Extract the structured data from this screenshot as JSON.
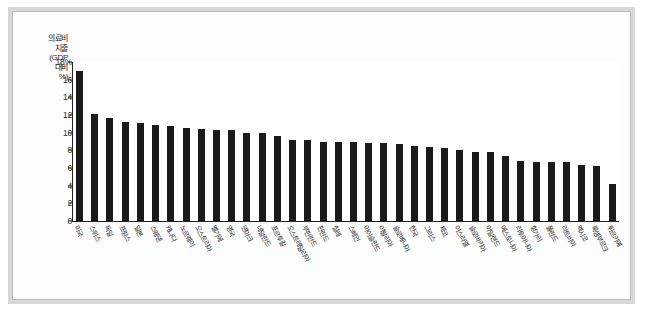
{
  "chart_data": {
    "type": "bar",
    "title": "",
    "xlabel": "",
    "ylabel": "의료비 지출 (GDP 대비 %)",
    "ylim": [
      0,
      18
    ],
    "ytick_labels": [
      "18%",
      "16",
      "14",
      "12",
      "10",
      "8",
      "6",
      "4",
      "2",
      "0"
    ],
    "ytick_values": [
      18,
      16,
      14,
      12,
      10,
      8,
      6,
      4,
      2,
      0
    ],
    "grid": false,
    "legend": null,
    "bar_color": "#1a1a1a",
    "categories": [
      "미국",
      "스위스",
      "독일",
      "프랑스",
      "일본",
      "스웨덴",
      "캐나다",
      "노르웨이",
      "오스트리아",
      "벨기에",
      "영국",
      "덴마크",
      "네덜란드",
      "포르투갈",
      "오스트레일리아",
      "부핀란드",
      "핀란드",
      "칠레",
      "스페인",
      "아이슬란드",
      "이탈리아",
      "슬로베니아",
      "한국",
      "그리스",
      "체코",
      "이스라엘",
      "슬로바키아",
      "아일랜드",
      "에스토니아",
      "리투아니아",
      "헝가리",
      "폴란드",
      "라트비아",
      "멕시코",
      "룩셈부르크",
      "튀르키예"
    ],
    "values": [
      17.0,
      12.1,
      11.7,
      11.2,
      11.1,
      10.9,
      10.8,
      10.5,
      10.4,
      10.3,
      10.3,
      10.0,
      10.0,
      9.6,
      9.2,
      9.2,
      9.0,
      8.9,
      8.9,
      8.8,
      8.8,
      8.7,
      8.5,
      8.4,
      8.3,
      8.0,
      7.8,
      7.8,
      7.4,
      6.8,
      6.7,
      6.7,
      6.7,
      6.3,
      6.2,
      4.2
    ]
  },
  "y_axis_title_lines": [
    "의료비",
    "지출",
    "(GDP",
    "대비",
    "%)"
  ]
}
